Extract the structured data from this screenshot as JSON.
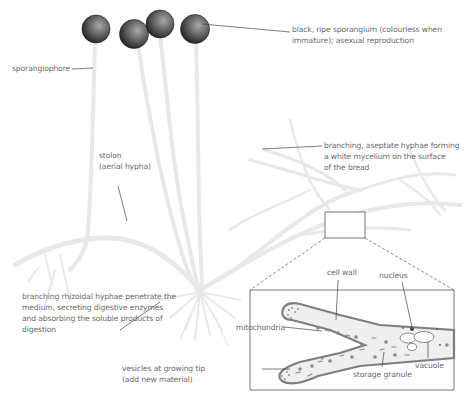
{
  "diagram": {
    "colors": {
      "hyphae": "#e6e6e6",
      "sporangium_dark": "#222222",
      "sporangium_light": "#9a9a9a",
      "leader_line": "#444444",
      "label_text": "#6a6a6a",
      "cell_fill": "#efefef",
      "cell_wall": "#8a8a8a"
    },
    "labels": {
      "sporangium": {
        "line1": "black, ripe sporangium (colourless when",
        "line2": "immature); asexual reproduction"
      },
      "sporangiophore": "sporangiophore",
      "mycelium": {
        "line1": "branching, aseptate hyphae forming",
        "line2": "a white mycelium on the surface",
        "line3": "of the bread"
      },
      "stolon": {
        "line1": "stolon",
        "line2": "(aerial hypha)"
      },
      "rhizoids": {
        "line1": "branching rhizoidal hyphae penetrate the",
        "line2": "medium, secreting digestive enzymes",
        "line3": "and absorbing the soluble products of",
        "line4": "digestion"
      },
      "inset": {
        "cell_wall": "cell wall",
        "nucleus": "nucleus",
        "mitochondria": "mitochondria",
        "vesicles": {
          "line1": "vesicles at growing tip",
          "line2": "(add new material)"
        },
        "storage_granule": "storage granule",
        "vacuole": "vacuole"
      }
    }
  }
}
